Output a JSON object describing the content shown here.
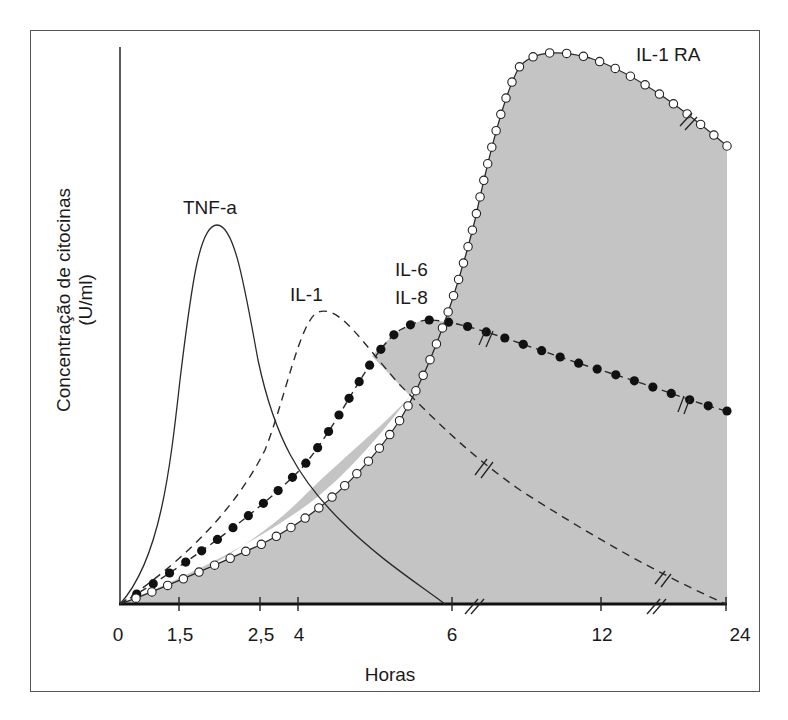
{
  "chart_data": {
    "type": "line",
    "title": "",
    "xlabel": "Horas",
    "ylabel": "Concentração de citocinas",
    "ylabel_unit": "(U/ml)",
    "x_ticks": [
      "0",
      "1,5",
      "2,5",
      "4",
      "6",
      "12",
      "24"
    ],
    "x_tick_values": [
      0,
      1.5,
      2.5,
      4,
      6,
      12,
      24
    ],
    "x_axis_breaks": [
      "between 6 and 12",
      "between 12 and 24"
    ],
    "y_ticks": [],
    "grid": false,
    "legend": "inline labels",
    "shaded_region": "area under IL-1 RA and IL-6/IL-8 envelope (grey)",
    "series": [
      {
        "name": "TNF-a",
        "style": "solid line",
        "x": [
          0,
          1.5,
          2,
          2.5,
          4,
          6
        ],
        "values": [
          0,
          70,
          100,
          75,
          25,
          0
        ]
      },
      {
        "name": "IL-1",
        "style": "dashed line",
        "x": [
          0,
          2.5,
          4,
          6,
          12,
          24
        ],
        "values": [
          0,
          60,
          77,
          36,
          6,
          0
        ]
      },
      {
        "name": "IL-6 / IL-8",
        "style": "dashed line with filled circles",
        "x": [
          0,
          2.5,
          4,
          6,
          12,
          24
        ],
        "values": [
          0,
          38,
          75,
          68,
          56,
          51
        ]
      },
      {
        "name": "IL-1 RA",
        "style": "solid line with open circles",
        "x": [
          0,
          2.5,
          4,
          6,
          9,
          12,
          24
        ],
        "values": [
          0,
          20,
          50,
          120,
          147,
          140,
          123
        ]
      }
    ],
    "annotations": [
      "TNF-a",
      "IL-1",
      "IL-6",
      "IL-8",
      "IL-1 RA"
    ]
  },
  "labels": {
    "tnf": "TNF-a",
    "il1": "IL-1",
    "il6": "IL-6",
    "il8": "IL-8",
    "il1ra": "IL-1 RA",
    "ylabel_line1": "Concentração de citocinas",
    "ylabel_line2": "(U/ml)",
    "xlabel": "Horas",
    "ticks": [
      "0",
      "1,5",
      "2,5",
      "4",
      "6",
      "12",
      "24"
    ]
  },
  "colors": {
    "shade": "#c4c4c4",
    "line": "#2a2a2a",
    "frame": "#555555"
  }
}
